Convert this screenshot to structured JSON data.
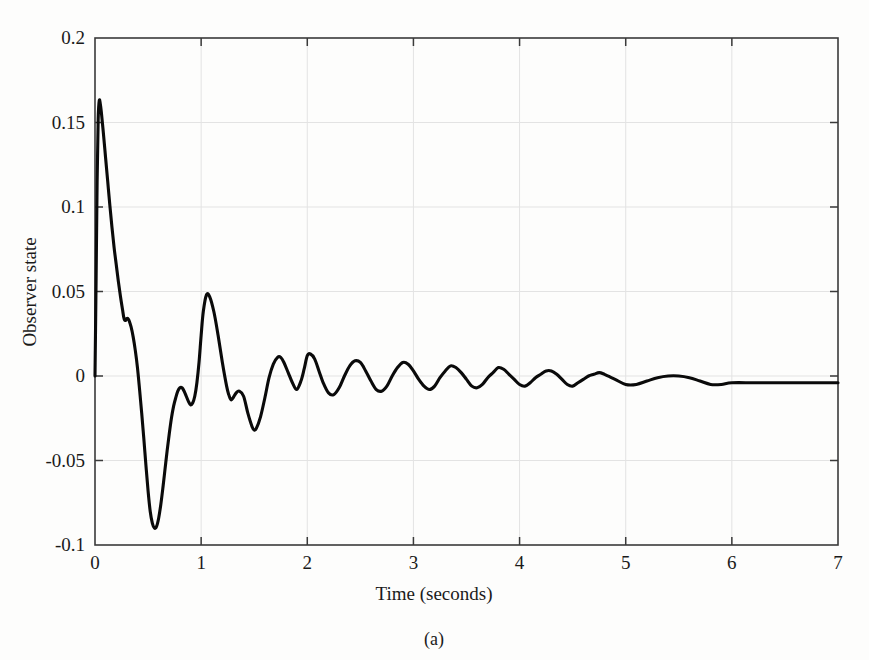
{
  "figure": {
    "caption": "(a)",
    "background_color": "#fdfdfc"
  },
  "chart_data": {
    "type": "line",
    "title": "",
    "xlabel": "Time (seconds)",
    "ylabel": "Observer state",
    "xlim": [
      0,
      7
    ],
    "ylim": [
      -0.1,
      0.2
    ],
    "xticks": [
      0,
      1,
      2,
      3,
      4,
      5,
      6,
      7
    ],
    "xtick_labels": [
      "0",
      "1",
      "2",
      "3",
      "4",
      "5",
      "6",
      "7"
    ],
    "yticks": [
      -0.1,
      -0.05,
      0,
      0.05,
      0.1,
      0.15,
      0.2
    ],
    "ytick_labels": [
      "-0.1",
      "-0.05",
      "0",
      "0.05",
      "0.1",
      "0.15",
      "0.2"
    ],
    "grid": true,
    "grid_color": "#e3e3e3",
    "legend": null,
    "line_color": "#0a0a0a",
    "line_width": 3.1,
    "series": [
      {
        "name": "Observer state",
        "x": [
          0.0,
          0.01,
          0.02,
          0.03,
          0.04,
          0.05,
          0.06,
          0.08,
          0.1,
          0.12,
          0.14,
          0.16,
          0.18,
          0.2,
          0.22,
          0.24,
          0.26,
          0.27,
          0.28,
          0.29,
          0.3,
          0.31,
          0.32,
          0.34,
          0.36,
          0.38,
          0.4,
          0.42,
          0.44,
          0.46,
          0.48,
          0.5,
          0.52,
          0.54,
          0.56,
          0.58,
          0.6,
          0.62,
          0.64,
          0.66,
          0.68,
          0.7,
          0.72,
          0.74,
          0.76,
          0.78,
          0.8,
          0.82,
          0.84,
          0.86,
          0.88,
          0.9,
          0.92,
          0.94,
          0.96,
          0.98,
          1.0,
          1.02,
          1.05,
          1.08,
          1.12,
          1.16,
          1.2,
          1.24,
          1.26,
          1.28,
          1.3,
          1.33,
          1.36,
          1.4,
          1.44,
          1.48,
          1.5,
          1.52,
          1.56,
          1.6,
          1.64,
          1.68,
          1.72,
          1.75,
          1.78,
          1.82,
          1.86,
          1.9,
          1.94,
          1.97,
          2.0,
          2.03,
          2.07,
          2.11,
          2.15,
          2.2,
          2.25,
          2.3,
          2.35,
          2.4,
          2.45,
          2.5,
          2.55,
          2.6,
          2.65,
          2.7,
          2.75,
          2.8,
          2.85,
          2.9,
          2.95,
          3.0,
          3.05,
          3.1,
          3.15,
          3.2,
          3.25,
          3.3,
          3.35,
          3.4,
          3.45,
          3.5,
          3.55,
          3.6,
          3.65,
          3.7,
          3.75,
          3.8,
          3.85,
          3.9,
          3.95,
          4.0,
          4.05,
          4.1,
          4.15,
          4.2,
          4.25,
          4.3,
          4.35,
          4.4,
          4.45,
          4.5,
          4.55,
          4.6,
          4.65,
          4.7,
          4.75,
          4.8,
          4.9,
          5.0,
          5.1,
          5.2,
          5.3,
          5.4,
          5.5,
          5.6,
          5.7,
          5.8,
          5.9,
          6.0,
          6.2,
          6.4,
          6.6,
          6.8,
          7.0
        ],
        "y": [
          0.0,
          0.055,
          0.115,
          0.152,
          0.163,
          0.161,
          0.156,
          0.143,
          0.129,
          0.115,
          0.101,
          0.088,
          0.076,
          0.066,
          0.056,
          0.047,
          0.039,
          0.035,
          0.033,
          0.033,
          0.034,
          0.034,
          0.033,
          0.029,
          0.023,
          0.015,
          0.005,
          -0.008,
          -0.022,
          -0.037,
          -0.053,
          -0.068,
          -0.08,
          -0.087,
          -0.09,
          -0.089,
          -0.084,
          -0.076,
          -0.066,
          -0.055,
          -0.044,
          -0.034,
          -0.025,
          -0.018,
          -0.013,
          -0.009,
          -0.007,
          -0.007,
          -0.009,
          -0.012,
          -0.015,
          -0.017,
          -0.016,
          -0.012,
          -0.004,
          0.008,
          0.024,
          0.038,
          0.048,
          0.047,
          0.038,
          0.024,
          0.008,
          -0.006,
          -0.011,
          -0.014,
          -0.013,
          -0.01,
          -0.009,
          -0.012,
          -0.022,
          -0.03,
          -0.032,
          -0.031,
          -0.024,
          -0.013,
          -0.001,
          0.007,
          0.011,
          0.011,
          0.008,
          0.002,
          -0.004,
          -0.008,
          -0.003,
          0.004,
          0.012,
          0.013,
          0.01,
          0.003,
          -0.004,
          -0.01,
          -0.011,
          -0.007,
          0.0,
          0.006,
          0.009,
          0.008,
          0.003,
          -0.003,
          -0.008,
          -0.009,
          -0.006,
          0.0,
          0.005,
          0.008,
          0.007,
          0.003,
          -0.002,
          -0.006,
          -0.008,
          -0.006,
          -0.001,
          0.003,
          0.006,
          0.005,
          0.002,
          -0.002,
          -0.006,
          -0.007,
          -0.005,
          -0.001,
          0.002,
          0.005,
          0.004,
          0.001,
          -0.002,
          -0.005,
          -0.006,
          -0.004,
          -0.001,
          0.001,
          0.003,
          0.003,
          0.001,
          -0.002,
          -0.005,
          -0.006,
          -0.004,
          -0.002,
          0.0,
          0.001,
          0.002,
          0.001,
          -0.002,
          -0.005,
          -0.005,
          -0.003,
          -0.001,
          0.0,
          0.0,
          -0.001,
          -0.003,
          -0.005,
          -0.005,
          -0.004,
          -0.004,
          -0.004,
          -0.004,
          -0.004,
          -0.004
        ]
      }
    ]
  },
  "axes": {
    "x_title": "Time (seconds)",
    "y_title": "Observer state"
  }
}
